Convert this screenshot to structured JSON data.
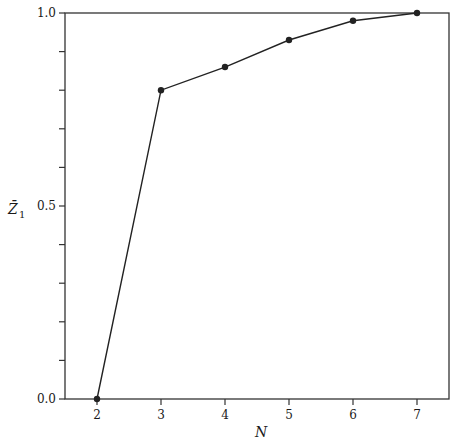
{
  "chart_data": {
    "type": "line",
    "title": "",
    "xlabel": "N",
    "ylabel": "Z̄1",
    "x": [
      2,
      3,
      4,
      5,
      6,
      7
    ],
    "series": [
      {
        "name": "Z̄1",
        "values": [
          0.0,
          0.8,
          0.86,
          0.93,
          0.98,
          1.0
        ],
        "marker": "circle"
      }
    ],
    "xlim": [
      1.5,
      7.5
    ],
    "ylim": [
      0.0,
      1.0
    ],
    "xticks": [
      2,
      3,
      4,
      5,
      6,
      7
    ],
    "yticks_labeled": [
      0.0,
      0.5,
      1.0
    ],
    "yticks_minor_step": 0.1,
    "grid": false,
    "legend": "none"
  },
  "labels": {
    "xlabel": "N",
    "ylabel_main": "Z̄",
    "ylabel_sub": "1",
    "ytick_labels": [
      "0.0",
      "0.5",
      "1.0"
    ],
    "xtick_labels": [
      "2",
      "3",
      "4",
      "5",
      "6",
      "7"
    ]
  },
  "colors": {
    "line": "#222222",
    "axis": "#333333",
    "background": "#ffffff"
  }
}
